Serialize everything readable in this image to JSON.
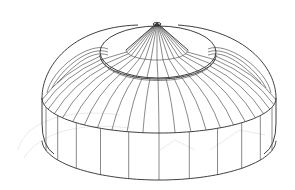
{
  "illustration": {
    "subject": "round tent / yurt line drawing",
    "style": "wireframe line art",
    "colors": {
      "background": "#ffffff",
      "line": "#3a3a3a",
      "faint_line": "#dcdcdc"
    },
    "geometry": {
      "apex": [
        157,
        23
      ],
      "cone_base": {
        "cx": 157,
        "cy": 50,
        "rx": 31,
        "ry": 10
      },
      "cap_ellipse": {
        "cx": 158,
        "cy": 52,
        "rx": 58,
        "ry": 26
      },
      "cap_ring": {
        "cx": 158,
        "cy": 55,
        "rx": 58,
        "ry": 24
      },
      "wall_top": {
        "cx": 159,
        "cy": 98,
        "rx": 117,
        "ry": 35
      },
      "wall_bottom": {
        "cx": 159,
        "cy": 140,
        "rx": 117,
        "ry": 40
      },
      "wall_height": 40,
      "roof_ribs": 22,
      "wall_posts": 12
    }
  }
}
